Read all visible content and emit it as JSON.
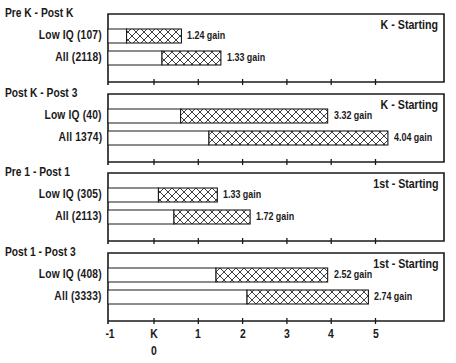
{
  "chart_data": {
    "type": "bar",
    "subtype": "floating-horizontal-bar (start level + gain)",
    "xlabel": "",
    "ylabel": "",
    "x_ticks": [
      "-1",
      "K",
      "1",
      "2",
      "3",
      "4",
      "5"
    ],
    "x_tick_values": [
      -1,
      0,
      1,
      2,
      3,
      4,
      5
    ],
    "x_sublabel": "0",
    "xlim": [
      -1,
      5.5
    ],
    "grid": false,
    "legend": null,
    "panels": [
      {
        "period": "Pre K - Post K",
        "cohort": "K - Starting",
        "rows": [
          {
            "label": "Low IQ (107)",
            "start": -0.62,
            "end": 0.62,
            "gain": 1.24,
            "gain_label": "1.24 gain"
          },
          {
            "label": "All (2118)",
            "start": 0.18,
            "end": 1.51,
            "gain": 1.33,
            "gain_label": "1.33 gain"
          }
        ]
      },
      {
        "period": "Post K - Post 3",
        "cohort": "K - Starting",
        "rows": [
          {
            "label": "Low IQ (40)",
            "start": 0.6,
            "end": 3.92,
            "gain": 3.32,
            "gain_label": "3.32 gain"
          },
          {
            "label": "All 1374)",
            "start": 1.24,
            "end": 5.28,
            "gain": 4.04,
            "gain_label": "4.04 gain"
          }
        ]
      },
      {
        "period": "Pre 1 - Post 1",
        "cohort": "1st - Starting",
        "rows": [
          {
            "label": "Low IQ (305)",
            "start": 0.1,
            "end": 1.43,
            "gain": 1.33,
            "gain_label": "1.33 gain"
          },
          {
            "label": "All (2113)",
            "start": 0.45,
            "end": 2.17,
            "gain": 1.72,
            "gain_label": "1.72 gain"
          }
        ]
      },
      {
        "period": "Post 1 - Post 3",
        "cohort": "1st - Starting",
        "rows": [
          {
            "label": "Low IQ (408)",
            "start": 1.4,
            "end": 3.92,
            "gain": 2.52,
            "gain_label": "2.52 gain"
          },
          {
            "label": "All (3333)",
            "start": 2.1,
            "end": 4.84,
            "gain": 2.74,
            "gain_label": "2.74 gain"
          }
        ]
      }
    ]
  },
  "colors": {
    "ink": "#1a1a1a",
    "background": "#ffffff",
    "hatch": "#2a2a2a"
  }
}
